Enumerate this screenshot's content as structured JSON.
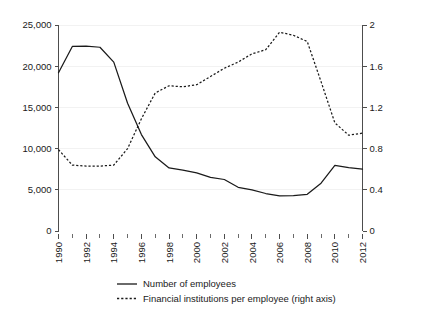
{
  "chart_data": {
    "type": "line",
    "title": "",
    "subtitle": "",
    "xlabel": "",
    "ylabel": "",
    "y2label": "",
    "grid": true,
    "legend_position": "bottom",
    "x": [
      1990,
      1991,
      1992,
      1993,
      1994,
      1995,
      1996,
      1997,
      1998,
      1999,
      2000,
      2001,
      2002,
      2003,
      2004,
      2005,
      2006,
      2007,
      2008,
      2009,
      2010,
      2011,
      2012
    ],
    "xlim": [
      1990,
      2012
    ],
    "xticks_major": [
      1990,
      1992,
      1994,
      1996,
      1998,
      2000,
      2002,
      2004,
      2006,
      2008,
      2010,
      2012
    ],
    "xticks_minor": [
      1991,
      1993,
      1995,
      1997,
      1999,
      2001,
      2003,
      2005,
      2007,
      2009,
      2011
    ],
    "xtick_labels": [
      "1990",
      "1992",
      "1994",
      "1996",
      "1998",
      "2000",
      "2002",
      "2004",
      "2006",
      "2008",
      "2010",
      "2012"
    ],
    "ylim": [
      0,
      25000
    ],
    "yticks": [
      0,
      5000,
      10000,
      15000,
      20000,
      25000
    ],
    "ytick_labels": [
      "0",
      "5,000",
      "10,000",
      "15,000",
      "20,000",
      "25,000"
    ],
    "y2lim": [
      0,
      2
    ],
    "y2ticks": [
      0,
      0.4,
      0.8,
      1.2,
      1.6,
      2
    ],
    "y2tick_labels": [
      "0",
      "0.4",
      "0.8",
      "1.2",
      "1.6",
      "2"
    ],
    "series": [
      {
        "name": "Number of employees",
        "axis": "left",
        "style": "solid",
        "color": "#1a1a1a",
        "values": [
          19200,
          22400,
          22450,
          22300,
          20500,
          15500,
          11700,
          9000,
          7650,
          7400,
          7050,
          6500,
          6250,
          5300,
          5000,
          4550,
          4250,
          4300,
          4450,
          5800,
          7950,
          7700,
          7500
        ]
      },
      {
        "name": "Financial institutions per employee (right axis)",
        "axis": "right",
        "style": "dashed",
        "color": "#1a1a1a",
        "values": [
          0.79,
          0.64,
          0.63,
          0.63,
          0.64,
          0.8,
          1.09,
          1.34,
          1.41,
          1.4,
          1.42,
          1.5,
          1.58,
          1.64,
          1.72,
          1.76,
          1.93,
          1.9,
          1.84,
          1.45,
          1.05,
          0.93,
          0.95
        ]
      }
    ],
    "legend": [
      {
        "label": "Number of employees",
        "style": "solid"
      },
      {
        "label": "Financial institutions per employee (right axis)",
        "style": "dashed"
      }
    ]
  }
}
